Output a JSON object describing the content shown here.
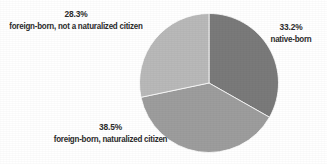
{
  "chart_data": {
    "type": "pie",
    "title": "",
    "subtitle": "",
    "xlabel": "",
    "ylabel": "",
    "legend_position": "none",
    "grid": false,
    "labels_outside": true,
    "categories": [
      "native-born",
      "foreign-born, naturalized citizen",
      "foreign-born, not a naturalized citizen"
    ],
    "values": [
      33.2,
      38.5,
      28.3
    ],
    "value_unit": "percent",
    "slices": [
      {
        "label": "native-born",
        "value": 33.2,
        "value_text": "33.2%",
        "color": "#7a7a7a",
        "start_angle_deg": 0,
        "end_angle_deg": 119.5,
        "label_position": "right"
      },
      {
        "label": "foreign-born, naturalized citizen",
        "value": 38.5,
        "value_text": "38.5%",
        "color": "#9d9d9d",
        "start_angle_deg": 119.5,
        "end_angle_deg": 258.1,
        "label_position": "bottom-left"
      },
      {
        "label": "foreign-born, not a naturalized citizen",
        "value": 28.3,
        "value_text": "28.3%",
        "color": "#b9b9b9",
        "start_angle_deg": 258.1,
        "end_angle_deg": 360,
        "label_position": "top-left"
      }
    ]
  },
  "figure": {
    "background_color": "#ffffff",
    "text_color": "#2b2b2b"
  }
}
